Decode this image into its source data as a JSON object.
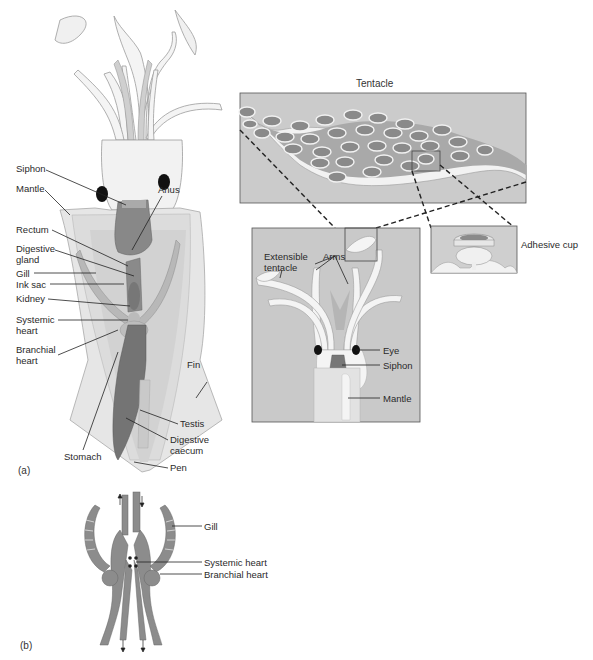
{
  "figure": {
    "panel_a_tag": "(a)",
    "panel_b_tag": "(b)"
  },
  "squid_body_labels": {
    "siphon": "Siphon",
    "mantle": "Mantle",
    "anus": "Anus",
    "rectum": "Rectum",
    "digestive_gland": "Digestive\ngland",
    "gill": "Gill",
    "ink_sac": "Ink sac",
    "kidney": "Kidney",
    "systemic_heart": "Systemic\nheart",
    "branchial_heart": "Branchial\nheart",
    "fin": "Fin",
    "testis": "Testis",
    "digestive_caecum": "Digestive\ncaecum",
    "stomach": "Stomach",
    "pen": "Pen"
  },
  "tentacle_inset": {
    "title": "Tentacle",
    "adhesive_cup": "Adhesive cup"
  },
  "head_inset": {
    "extensible_tentacle": "Extensible\ntentacle",
    "arms": "Arms",
    "eye": "Eye",
    "siphon": "Siphon",
    "mantle": "Mantle"
  },
  "circulation_labels": {
    "gill": "Gill",
    "systemic_heart": "Systemic heart",
    "branchial_heart": "Branchial heart"
  },
  "colors": {
    "body_fill": "#e4e4e4",
    "organ_dark": "#7a7a7a",
    "organ_mid": "#9a9a9a",
    "panel_bg": "#c8c8c8",
    "line": "#222222"
  }
}
